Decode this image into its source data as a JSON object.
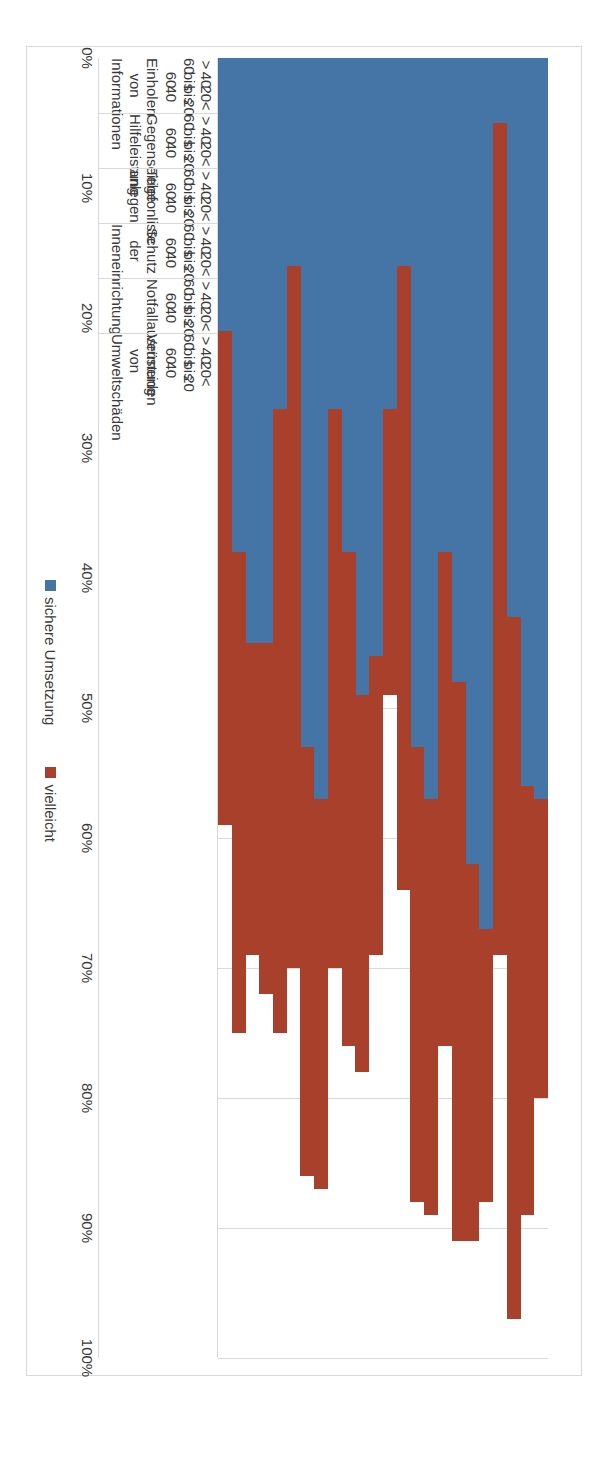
{
  "chart_data": {
    "type": "bar",
    "orientation": "horizontal-stacked",
    "title": "",
    "xlabel": "",
    "ylabel": "",
    "ylim": [
      0,
      100
    ],
    "grid": true,
    "legend_position": "bottom",
    "value_ticks": [
      "0%",
      "10%",
      "20%",
      "30%",
      "40%",
      "50%",
      "60%",
      "70%",
      "80%",
      "90%",
      "100%"
    ],
    "age_groups": [
      "> 60",
      "40 bis\n60",
      "20 bis\n40",
      "< 20"
    ],
    "categories": [
      "Einholen von Informationen",
      "Gegenseitige Hilfeleistung",
      "Telefonliste anlegen",
      "Schutz der Inneneinrichtung",
      "Notfallausrüstung",
      "Vermeiden von\nUmweltschäden"
    ],
    "series": [
      {
        "name": "sichere Umsetzung",
        "color": "#4574A6"
      },
      {
        "name": "vielleicht",
        "color": "#A9402C"
      }
    ],
    "groups": [
      {
        "category": "Einholen von Informationen",
        "rows": [
          {
            "age": "> 60",
            "sichere_umsetzung": 57,
            "vielleicht": 23
          },
          {
            "age": "40 bis\n60",
            "sichere_umsetzung": 56,
            "vielleicht": 33
          },
          {
            "age": "20 bis\n40",
            "sichere_umsetzung": 43,
            "vielleicht": 54
          },
          {
            "age": "< 20",
            "sichere_umsetzung": 5,
            "vielleicht": 64
          }
        ]
      },
      {
        "category": "Gegenseitige Hilfeleistung",
        "rows": [
          {
            "age": "> 60",
            "sichere_umsetzung": 67,
            "vielleicht": 21
          },
          {
            "age": "40 bis\n60",
            "sichere_umsetzung": 62,
            "vielleicht": 29
          },
          {
            "age": "20 bis\n40",
            "sichere_umsetzung": 48,
            "vielleicht": 43
          },
          {
            "age": "< 20",
            "sichere_umsetzung": 38,
            "vielleicht": 38
          }
        ]
      },
      {
        "category": "Telefonliste anlegen",
        "rows": [
          {
            "age": "> 60",
            "sichere_umsetzung": 57,
            "vielleicht": 32
          },
          {
            "age": "40 bis\n60",
            "sichere_umsetzung": 53,
            "vielleicht": 35
          },
          {
            "age": "20 bis\n40",
            "sichere_umsetzung": 16,
            "vielleicht": 48
          },
          {
            "age": "< 20",
            "sichere_umsetzung": 27,
            "vielleicht": 22
          }
        ]
      },
      {
        "category": "Schutz der Inneneinrichtung",
        "rows": [
          {
            "age": "> 60",
            "sichere_umsetzung": 46,
            "vielleicht": 23
          },
          {
            "age": "40 bis\n60",
            "sichere_umsetzung": 49,
            "vielleicht": 29
          },
          {
            "age": "20 bis\n40",
            "sichere_umsetzung": 38,
            "vielleicht": 38
          },
          {
            "age": "< 20",
            "sichere_umsetzung": 27,
            "vielleicht": 43
          }
        ]
      },
      {
        "category": "Notfallausrüstung",
        "rows": [
          {
            "age": "> 60",
            "sichere_umsetzung": 57,
            "vielleicht": 30
          },
          {
            "age": "40 bis\n60",
            "sichere_umsetzung": 53,
            "vielleicht": 33
          },
          {
            "age": "20 bis\n40",
            "sichere_umsetzung": 16,
            "vielleicht": 54
          },
          {
            "age": "< 20",
            "sichere_umsetzung": 27,
            "vielleicht": 48
          }
        ]
      },
      {
        "category": "Vermeiden von\nUmweltschäden",
        "rows": [
          {
            "age": "> 60",
            "sichere_umsetzung": 45,
            "vielleicht": 27
          },
          {
            "age": "40 bis\n60",
            "sichere_umsetzung": 45,
            "vielleicht": 24
          },
          {
            "age": "20 bis\n40",
            "sichere_umsetzung": 38,
            "vielleicht": 37
          },
          {
            "age": "< 20",
            "sichere_umsetzung": 21,
            "vielleicht": 38
          }
        ]
      }
    ]
  },
  "legend": {
    "items": [
      {
        "label": "sichere Umsetzung",
        "color": "#4574A6"
      },
      {
        "label": "vielleicht",
        "color": "#A9402C"
      }
    ]
  },
  "colors": {
    "series_blue": "#4574A6",
    "series_red": "#A9402C",
    "gridline": "#d9d9d9",
    "text": "#3a3a3a"
  }
}
